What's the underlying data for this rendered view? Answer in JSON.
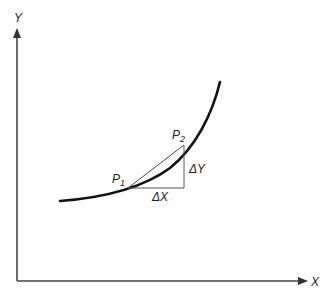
{
  "diagram": {
    "axes": {
      "x_label": "X",
      "y_label": "Y"
    },
    "curve": {
      "description": "increasing convex curve",
      "color": "#111111"
    },
    "points": [
      {
        "name": "P1",
        "letter": "P",
        "subscript": "1"
      },
      {
        "name": "P2",
        "letter": "P",
        "subscript": "2"
      }
    ],
    "triangle": {
      "dx_label": "ΔX",
      "dy_label": "ΔY",
      "color": "#555555"
    },
    "colors": {
      "axis": "#444444",
      "curve": "#111111",
      "secant": "#444444",
      "text": "#222222"
    }
  }
}
